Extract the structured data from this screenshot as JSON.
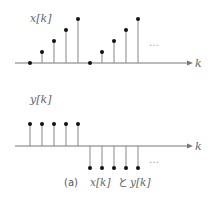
{
  "top_plot": {
    "label": "x[k]",
    "axis_label": "k",
    "values": [
      0,
      1,
      2,
      3,
      4,
      0,
      1,
      2,
      3,
      4
    ],
    "continuation": "…"
  },
  "bottom_plot": {
    "label": "y[k]",
    "axis_label": "k",
    "values": [
      1,
      1,
      1,
      1,
      1,
      -1,
      -1,
      -1,
      -1,
      -1
    ],
    "continuation": "…"
  },
  "caption": {
    "prefix": "(a)",
    "text_1": "x[k]",
    "joiner": "と",
    "text_2": "y[k]"
  },
  "colors": {
    "stem": "#888888",
    "dot": "#111111",
    "axis": "#777777"
  }
}
